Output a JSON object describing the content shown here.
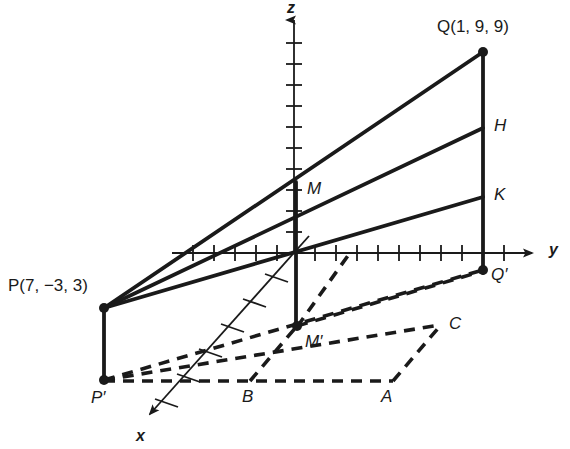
{
  "figure": {
    "kind": "3d-coordinate-diagram",
    "background_color": "#ffffff",
    "stroke_color": "#1a1a1a",
    "width": 570,
    "height": 449
  },
  "axes": {
    "x": {
      "label": "x",
      "origin": [
        294,
        253
      ],
      "tip": [
        144,
        420
      ],
      "tick_count": 6,
      "label_pos": [
        138,
        428
      ]
    },
    "y": {
      "label": "y",
      "origin": [
        294,
        253
      ],
      "tip": [
        540,
        253
      ],
      "tick_count": 16,
      "label_pos": [
        551,
        243
      ]
    },
    "z": {
      "label": "z",
      "origin": [
        294,
        253
      ],
      "tip": [
        294,
        14
      ],
      "tick_count": 10,
      "label_pos": [
        288,
        2
      ]
    }
  },
  "points": {
    "Q": {
      "label": "Q(1, 9, 9)",
      "name": "Q",
      "coords": "(1, 9, 9)",
      "pos": [
        483,
        52
      ],
      "label_pos": [
        438,
        20
      ],
      "dot": true
    },
    "P": {
      "label": "P(7, −3, 3)",
      "name": "P",
      "coords": "(7, −3, 3)",
      "pos": [
        104,
        308
      ],
      "label_pos": [
        9,
        278
      ],
      "dot": true
    },
    "H": {
      "label": "H",
      "pos": [
        483,
        128
      ],
      "label_pos": [
        494,
        118
      ],
      "dot": false
    },
    "K": {
      "label": "K",
      "pos": [
        483,
        197
      ],
      "label_pos": [
        494,
        187
      ],
      "dot": false
    },
    "M": {
      "label": "M",
      "pos": [
        296,
        182
      ],
      "label_pos": [
        308,
        182
      ],
      "dot": false
    },
    "Mprime": {
      "label": "M′",
      "pos": [
        296,
        325
      ],
      "label_pos": [
        306,
        334
      ],
      "dot": true
    },
    "Qprime": {
      "label": "Q′",
      "pos": [
        483,
        270
      ],
      "label_pos": [
        492,
        268
      ],
      "dot": true
    },
    "Pprime": {
      "label": "P′",
      "pos": [
        104,
        380
      ],
      "label_pos": [
        94,
        390
      ],
      "dot": true
    },
    "A": {
      "label": "A",
      "pos": [
        393,
        380
      ],
      "label_pos": [
        383,
        389
      ],
      "dot": false
    },
    "B": {
      "label": "B",
      "pos": [
        250,
        380
      ],
      "label_pos": [
        242,
        389
      ],
      "dot": false
    },
    "C": {
      "label": "C",
      "pos": [
        440,
        325
      ],
      "label_pos": [
        450,
        316
      ],
      "dot": false
    }
  },
  "segments_solid": [
    {
      "name": "P-to-Q",
      "from": [
        104,
        308
      ],
      "to": [
        483,
        52
      ]
    },
    {
      "name": "Q-to-Qprime",
      "from": [
        483,
        52
      ],
      "to": [
        483,
        272
      ]
    },
    {
      "name": "P-to-H",
      "from": [
        104,
        308
      ],
      "to": [
        483,
        128
      ]
    },
    {
      "name": "P-to-K-lower",
      "from": [
        104,
        308
      ],
      "to": [
        483,
        197
      ]
    },
    {
      "name": "P-to-Pprime",
      "from": [
        104,
        308
      ],
      "to": [
        104,
        380
      ]
    },
    {
      "name": "M-to-Mprime",
      "from": [
        296,
        182
      ],
      "to": [
        296,
        327
      ]
    }
  ],
  "segments_dashed": [
    {
      "name": "Pprime-to-Qprime",
      "from": [
        104,
        380
      ],
      "to": [
        483,
        270
      ]
    },
    {
      "name": "Pprime-to-Mprime-to-C",
      "from": [
        104,
        380
      ],
      "to": [
        440,
        325
      ]
    },
    {
      "name": "Pprime-to-A",
      "from": [
        104,
        380
      ],
      "to": [
        393,
        380
      ]
    },
    {
      "name": "Mprime-base-right",
      "from": [
        296,
        325
      ],
      "to": [
        440,
        325
      ]
    },
    {
      "name": "B-to-Mprime",
      "from": [
        250,
        380
      ],
      "to": [
        296,
        325
      ]
    },
    {
      "name": "A-to-C",
      "from": [
        393,
        380
      ],
      "to": [
        440,
        325
      ]
    },
    {
      "name": "Mprime-to-Qprime",
      "from": [
        296,
        325
      ],
      "to": [
        483,
        270
      ]
    },
    {
      "name": "Mprime-to-yaxis",
      "from": [
        296,
        327
      ],
      "to": [
        350,
        250
      ]
    }
  ],
  "notes": {
    "line_width_solid": 3,
    "line_width_axis": 1.6,
    "dash_pattern": "11 8"
  }
}
